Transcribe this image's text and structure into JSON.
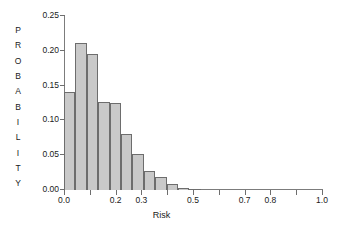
{
  "chart_data": {
    "type": "bar",
    "title": "",
    "subtitle": "",
    "xlabel": "Risk",
    "ylabel": "PROBABILITY",
    "xlim": [
      0.0,
      1.0
    ],
    "ylim": [
      0.0,
      0.25
    ],
    "grid": false,
    "legend": null,
    "bin_width": 0.0442,
    "x_tick_values": [
      0.0,
      0.1,
      0.2,
      0.3,
      0.4,
      0.5,
      0.6,
      0.7,
      0.8,
      0.9,
      1.0
    ],
    "x_tick_labels": [
      "0.0",
      "",
      "0.2",
      "0.3",
      "",
      "0.5",
      "",
      "0.7",
      "0.8",
      "",
      "1.0"
    ],
    "y_tick_values": [
      0.0,
      0.05,
      0.1,
      0.15,
      0.2,
      0.25
    ],
    "y_tick_labels": [
      "0.00",
      "0.05",
      "0.10",
      "0.15",
      "0.20",
      "0.25"
    ],
    "bar_fill_color": "#c9c9c9",
    "bar_edge_color": "#6d6d6d",
    "axis_color": "#7c7c7c",
    "background_color": "#ffffff",
    "categories": [
      "0.00",
      "0.04",
      "0.09",
      "0.13",
      "0.18",
      "0.22",
      "0.27",
      "0.31",
      "0.35",
      "0.40",
      "0.44",
      "0.49"
    ],
    "bin_left_edges": [
      0.0,
      0.0442,
      0.0884,
      0.1326,
      0.1768,
      0.221,
      0.2652,
      0.3094,
      0.3536,
      0.3978,
      0.442,
      0.4862
    ],
    "values": [
      0.141,
      0.211,
      0.195,
      0.126,
      0.125,
      0.081,
      0.052,
      0.028,
      0.019,
      0.009,
      0.003,
      0.0015
    ]
  },
  "ylabel_letters": [
    "P",
    "R",
    "O",
    "B",
    "A",
    "B",
    "I",
    "L",
    "I",
    "T",
    "Y"
  ]
}
